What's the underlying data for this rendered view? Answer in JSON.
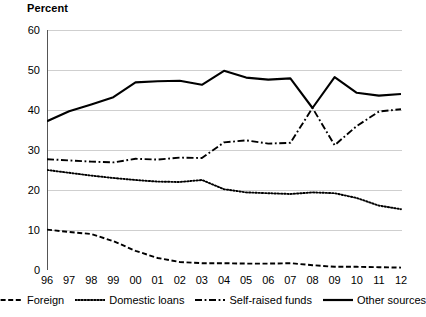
{
  "chart_data": {
    "type": "line",
    "title": "",
    "ylabel": "Percent",
    "xlabel": "",
    "ylim": [
      0,
      60
    ],
    "ytick_labels": [
      "60",
      "50",
      "40",
      "30",
      "20",
      "10",
      "0"
    ],
    "ytick_values": [
      60,
      50,
      40,
      30,
      20,
      10,
      0
    ],
    "grid": true,
    "grid_axis": "y",
    "legend_position": "bottom",
    "categories": [
      "96",
      "97",
      "98",
      "99",
      "00",
      "01",
      "02",
      "03",
      "04",
      "05",
      "06",
      "07",
      "08",
      "09",
      "10",
      "11",
      "12"
    ],
    "x": [
      1996,
      1997,
      1998,
      1999,
      2000,
      2001,
      2002,
      2003,
      2004,
      2005,
      2006,
      2007,
      2008,
      2009,
      2010,
      2011,
      2012
    ],
    "series": [
      {
        "name": "Foreign",
        "style": "dashed",
        "color": "#000000",
        "values": [
          10.1,
          9.5,
          9.0,
          7.2,
          4.8,
          3.0,
          2.0,
          1.7,
          1.7,
          1.6,
          1.6,
          1.7,
          1.2,
          0.8,
          0.8,
          0.7,
          0.6
        ]
      },
      {
        "name": "Domestic loans",
        "style": "dotted",
        "color": "#000000",
        "values": [
          25.0,
          24.3,
          23.6,
          23.0,
          22.5,
          22.1,
          22.0,
          22.5,
          20.2,
          19.4,
          19.2,
          19.0,
          19.4,
          19.2,
          18.0,
          16.1,
          15.2
        ]
      },
      {
        "name": "Self-raised funds",
        "style": "dashdot",
        "color": "#000000",
        "values": [
          27.7,
          27.4,
          27.1,
          26.9,
          27.8,
          27.6,
          28.1,
          28.0,
          31.9,
          32.4,
          31.6,
          31.8,
          40.5,
          31.2,
          36.0,
          39.6,
          40.2
        ]
      },
      {
        "name": "Other sources",
        "style": "solid",
        "color": "#000000",
        "values": [
          37.2,
          39.7,
          41.4,
          43.2,
          46.9,
          47.2,
          47.3,
          46.3,
          49.8,
          48.1,
          47.6,
          47.9,
          40.5,
          48.2,
          44.3,
          43.6,
          44.0
        ]
      }
    ]
  },
  "legend": {
    "items": [
      {
        "label": "Foreign",
        "marker": "dashed-line-marker"
      },
      {
        "label": "Domestic loans",
        "marker": "dotted-line-marker"
      },
      {
        "label": "Self-raised funds",
        "marker": "dashdot-line-marker"
      },
      {
        "label": "Other sources",
        "marker": "solid-line-marker"
      }
    ]
  }
}
